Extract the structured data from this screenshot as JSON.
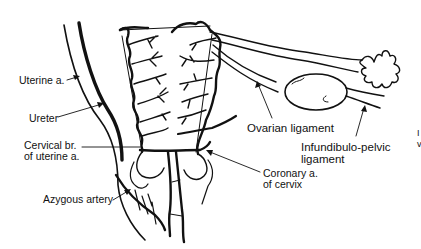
{
  "diagram": {
    "type": "anatomical-illustration",
    "labels": {
      "uterine_artery": "Uterine a.",
      "ureter": "Ureter",
      "cervical_branch_line1": "Cervical br.",
      "cervical_branch_line2": "of uterine a.",
      "azygous_artery": "Azygous artery",
      "ovarian_ligament": "Ovarian ligament",
      "infundibulo_line1": "Infundibulo-pelvic",
      "infundibulo_line2": "ligament",
      "coronary_line1": "Coronary a.",
      "coronary_line2": "of cervix",
      "edge_fragment_1": "I",
      "edge_fragment_2": "v"
    },
    "colors": {
      "line": "#111111",
      "background": "#ffffff"
    }
  }
}
